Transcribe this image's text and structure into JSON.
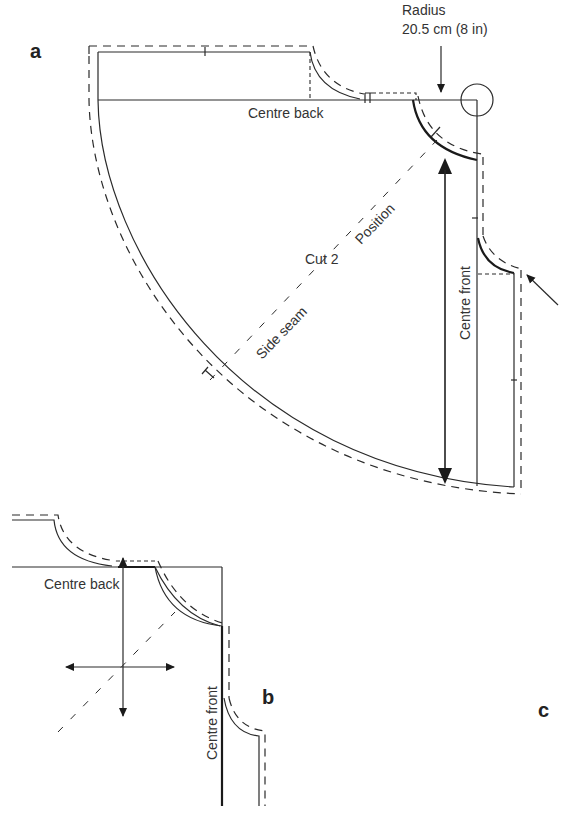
{
  "panels": {
    "a": {
      "label": "a"
    },
    "b": {
      "label": "b"
    },
    "c": {
      "label": "c"
    }
  },
  "annotations": {
    "radius_title": "Radius",
    "radius_value": "20.5 cm (8 in)",
    "centre_back_a": "Centre back",
    "centre_front_a": "Centre front",
    "cut": "Cut 2",
    "position": "Position",
    "side_seam": "Side seam",
    "centre_back_b": "Centre back",
    "centre_front_b": "Centre front"
  },
  "colors": {
    "line": "#2a2a2a",
    "background": "#ffffff"
  }
}
